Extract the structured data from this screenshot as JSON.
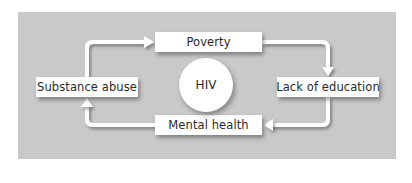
{
  "diagram": {
    "type": "cycle",
    "center": {
      "label": "HIV"
    },
    "nodes": [
      {
        "id": "poverty",
        "label": "Poverty",
        "position": "top"
      },
      {
        "id": "lack_of_education",
        "label": "Lack of education",
        "position": "right"
      },
      {
        "id": "mental_health",
        "label": "Mental health",
        "position": "bottom"
      },
      {
        "id": "substance_abuse",
        "label": "Substance abuse",
        "position": "left"
      }
    ],
    "edges": [
      {
        "from": "substance_abuse",
        "to": "poverty"
      },
      {
        "from": "poverty",
        "to": "lack_of_education"
      },
      {
        "from": "lack_of_education",
        "to": "mental_health"
      },
      {
        "from": "mental_health",
        "to": "substance_abuse"
      }
    ],
    "colors": {
      "panel": "#c9c9c9",
      "box": "#ffffff",
      "arrow": "#ffffff",
      "text": "#2a2a2a"
    }
  }
}
